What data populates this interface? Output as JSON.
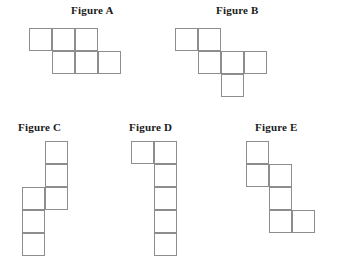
{
  "page": {
    "background_color": "#ffffff",
    "line_color": "#8d8d8d",
    "text_color": "#1a1a1a",
    "cell_size_px": 23
  },
  "figures": [
    {
      "id": "figure-a",
      "label": "Figure A",
      "label_x": 71,
      "label_y": 4,
      "origin_x": 29,
      "origin_y": 28,
      "cell": 23,
      "cells": [
        {
          "row": 0,
          "col": 0
        },
        {
          "row": 0,
          "col": 1
        },
        {
          "row": 0,
          "col": 2
        },
        {
          "row": 1,
          "col": 1
        },
        {
          "row": 1,
          "col": 2
        },
        {
          "row": 1,
          "col": 3
        }
      ],
      "cell_count": 6
    },
    {
      "id": "figure-b",
      "label": "Figure B",
      "label_x": 216,
      "label_y": 4,
      "origin_x": 175,
      "origin_y": 28,
      "cell": 23,
      "cells": [
        {
          "row": 0,
          "col": 0
        },
        {
          "row": 0,
          "col": 1
        },
        {
          "row": 1,
          "col": 1
        },
        {
          "row": 1,
          "col": 2
        },
        {
          "row": 1,
          "col": 3
        },
        {
          "row": 2,
          "col": 2
        }
      ],
      "cell_count": 6
    },
    {
      "id": "figure-c",
      "label": "Figure C",
      "label_x": 18,
      "label_y": 121,
      "origin_x": 22,
      "origin_y": 141,
      "cell": 23,
      "cells": [
        {
          "row": 0,
          "col": 1
        },
        {
          "row": 1,
          "col": 1
        },
        {
          "row": 2,
          "col": 0
        },
        {
          "row": 2,
          "col": 1
        },
        {
          "row": 3,
          "col": 0
        },
        {
          "row": 4,
          "col": 0
        }
      ],
      "cell_count": 6
    },
    {
      "id": "figure-d",
      "label": "Figure D",
      "label_x": 129,
      "label_y": 121,
      "origin_x": 131,
      "origin_y": 141,
      "cell": 23,
      "cells": [
        {
          "row": 0,
          "col": 0
        },
        {
          "row": 0,
          "col": 1
        },
        {
          "row": 1,
          "col": 1
        },
        {
          "row": 2,
          "col": 1
        },
        {
          "row": 3,
          "col": 1
        },
        {
          "row": 4,
          "col": 1
        }
      ],
      "cell_count": 6
    },
    {
      "id": "figure-e",
      "label": "Figure E",
      "label_x": 255,
      "label_y": 121,
      "origin_x": 246,
      "origin_y": 141,
      "cell": 23,
      "cells": [
        {
          "row": 0,
          "col": 0
        },
        {
          "row": 1,
          "col": 0
        },
        {
          "row": 1,
          "col": 1
        },
        {
          "row": 2,
          "col": 1
        },
        {
          "row": 3,
          "col": 1
        },
        {
          "row": 3,
          "col": 2
        }
      ],
      "cell_count": 6
    }
  ]
}
